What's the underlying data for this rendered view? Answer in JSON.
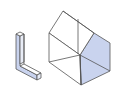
{
  "figure": {
    "colors": {
      "background": "#ffffff",
      "stroke": "#555555",
      "shade": "#c9d3ee"
    },
    "objects": [
      {
        "name": "l-shaped-bar",
        "shaded_faces": [
          "front-left"
        ]
      },
      {
        "name": "house-prism",
        "shaded_faces": [
          "right-gable-end"
        ]
      }
    ]
  }
}
